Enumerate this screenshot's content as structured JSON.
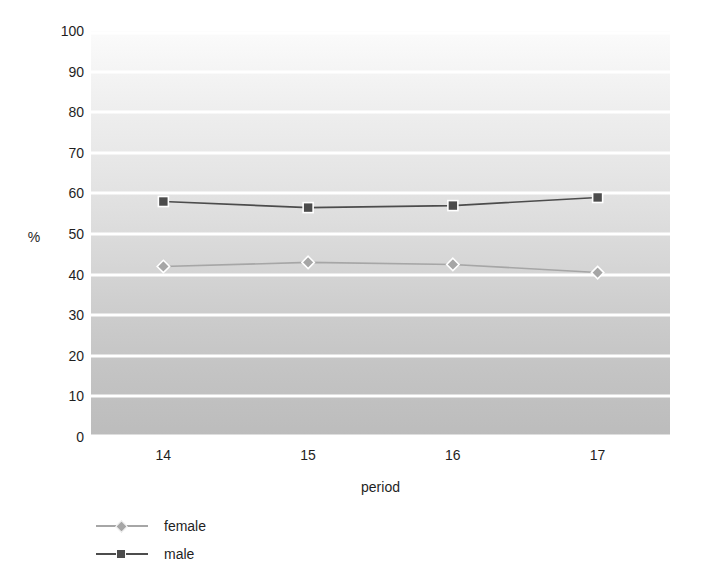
{
  "chart_data": {
    "type": "line",
    "title": "",
    "xlabel": "period",
    "ylabel": "%",
    "categories": [
      "14",
      "15",
      "16",
      "17"
    ],
    "x": [
      14,
      15,
      16,
      17
    ],
    "ylim": [
      0,
      100
    ],
    "yticks": [
      0,
      10,
      20,
      30,
      40,
      50,
      60,
      70,
      80,
      90,
      100
    ],
    "ytick_labels": [
      "0",
      "10",
      "20",
      "30",
      "40",
      "50",
      "60",
      "70",
      "80",
      "90",
      "100"
    ],
    "grid": "horizontal",
    "legend_position": "bottom-left",
    "series": [
      {
        "name": "female",
        "marker": "diamond",
        "color": "#a6a6a6",
        "values": [
          42,
          43,
          42.5,
          40.5
        ]
      },
      {
        "name": "male",
        "marker": "square",
        "color": "#4c4c4c",
        "values": [
          58,
          56.5,
          57,
          59
        ]
      }
    ]
  },
  "axes": {
    "y_title": "%",
    "x_title": "period"
  },
  "legend": {
    "items": [
      {
        "label": "female",
        "marker": "diamond-marker",
        "color": "#a6a6a6"
      },
      {
        "label": "male",
        "marker": "square-marker",
        "color": "#4c4c4c"
      }
    ]
  },
  "colors": {
    "female_series": "#a6a6a6",
    "male_series": "#4c4c4c",
    "gridline": "#ffffff",
    "plot_top": "#fbfbfb",
    "plot_bottom": "#bcbcbc"
  }
}
